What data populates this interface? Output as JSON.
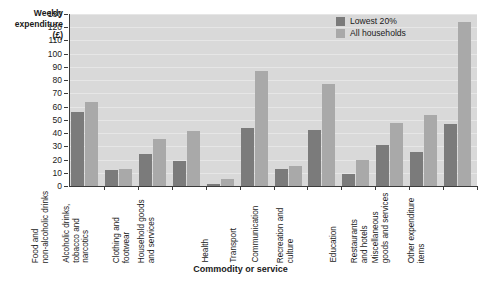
{
  "chart_data": {
    "type": "bar",
    "title": "",
    "ylabel": "Weekly expenditure (£)",
    "ylabel_lines": [
      "Weekly",
      "expenditure",
      "(£)"
    ],
    "xlabel": "Commodity or service",
    "ylim": [
      0,
      130
    ],
    "ytick_step": 10,
    "yticks": [
      0,
      10,
      20,
      30,
      40,
      50,
      60,
      70,
      80,
      90,
      100,
      110,
      120,
      130
    ],
    "grid": true,
    "legend_position": "top-right",
    "categories": [
      "Food and\nnon-alcoholic drinks",
      "Alcoholic drinks,\ntobacco and\nnarcotics",
      "Clothing and\nfootwear",
      "Household goods\nand services",
      "Health",
      "Transport",
      "Communication",
      "Recreation and\nculture",
      "Education",
      "Restaurants\nand hotels",
      "Miscellaneous\ngoods and services",
      "Other expenditure\nitems"
    ],
    "category_lines": [
      [
        "Food and",
        "non-alcoholic drinks"
      ],
      [
        "Alcoholic drinks,",
        "tobacco and",
        "narcotics"
      ],
      [
        "Clothing and",
        "footwear"
      ],
      [
        "Household goods",
        "and services"
      ],
      [
        "Health"
      ],
      [
        "Transport"
      ],
      [
        "Communication"
      ],
      [
        "Recreation and",
        "culture"
      ],
      [
        "Education"
      ],
      [
        "Restaurants",
        "and hotels"
      ],
      [
        "Miscellaneous",
        "goods and services"
      ],
      [
        "Other expenditure",
        "items"
      ]
    ],
    "series": [
      {
        "name": "Lowest 20%",
        "color": "#7b7b7b",
        "values": [
          56,
          12,
          24,
          19,
          1.5,
          44,
          12.5,
          42.5,
          9,
          31,
          26,
          47
        ]
      },
      {
        "name": "All households",
        "color": "#a9a9a9",
        "values": [
          63.5,
          13,
          35.5,
          41.5,
          5.5,
          87,
          15.5,
          77,
          19.5,
          48,
          54,
          124
        ]
      }
    ]
  },
  "colors": {
    "plot_background": "#d9d9d9",
    "gridline": "#e6e6e6",
    "axis": "#3b3b3b",
    "series_lowest20": "#7b7b7b",
    "series_all_households": "#a9a9a9",
    "text": "#1a1a1a"
  }
}
